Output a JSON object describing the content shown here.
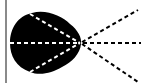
{
  "diagram": {
    "type": "light-rays-from-lens",
    "colors": {
      "background": "#ffffff",
      "blob": "#000000",
      "inner_rays": "#ffffff",
      "outer_rays": "#000000",
      "frame_border": "#8a8a8a"
    },
    "focal_point": {
      "x": 80,
      "y": 43
    },
    "inner_rays": [
      {
        "from": [
          30,
          14
        ],
        "to": [
          80,
          43
        ]
      },
      {
        "from": [
          10,
          43
        ],
        "to": [
          80,
          43
        ]
      },
      {
        "from": [
          30,
          72
        ],
        "to": [
          80,
          43
        ]
      }
    ],
    "outer_rays": [
      {
        "from": [
          80,
          43
        ],
        "to": [
          138,
          10
        ]
      },
      {
        "from": [
          80,
          43
        ],
        "to": [
          140,
          43
        ]
      },
      {
        "from": [
          80,
          43
        ],
        "to": [
          138,
          82
        ]
      }
    ]
  }
}
